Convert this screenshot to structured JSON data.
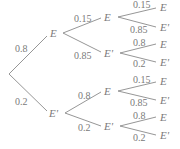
{
  "diagram": {
    "type": "probability-tree",
    "root": {
      "children": [
        {
          "label": "E",
          "prob": "0.8",
          "children": [
            {
              "label": "E",
              "prob": "0.15",
              "children": [
                {
                  "label": "E",
                  "prob": "0.15"
                },
                {
                  "label": "E'",
                  "prob": "0.85"
                }
              ]
            },
            {
              "label": "E'",
              "prob": "0.85",
              "children": [
                {
                  "label": "E",
                  "prob": "0.8"
                },
                {
                  "label": "E'",
                  "prob": "0.2"
                }
              ]
            }
          ]
        },
        {
          "label": "E'",
          "prob": "0.2",
          "children": [
            {
              "label": "E",
              "prob": "0.8",
              "children": [
                {
                  "label": "E",
                  "prob": "0.15"
                },
                {
                  "label": "E'",
                  "prob": "0.85"
                }
              ]
            },
            {
              "label": "E'",
              "prob": "0.2",
              "children": [
                {
                  "label": "E",
                  "prob": "0.8"
                },
                {
                  "label": "E'",
                  "prob": "0.2"
                }
              ]
            }
          ]
        }
      ]
    }
  },
  "colors": {
    "line": "#8a8a8a",
    "text": "#7a7a7a",
    "background": "#ffffff"
  }
}
